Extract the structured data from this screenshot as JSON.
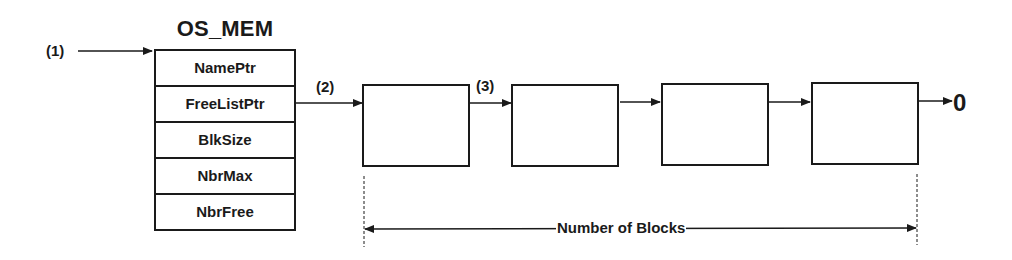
{
  "diagram": {
    "title": "OS_MEM",
    "struct_fields": [
      "NamePtr",
      "FreeListPtr",
      "BlkSize",
      "NbrMax",
      "NbrFree"
    ],
    "markers": {
      "m1": "(1)",
      "m2": "(2)",
      "m3": "(3)"
    },
    "blocks_count_visible": 4,
    "terminator": "0",
    "dimension_label": "Number of Blocks",
    "colors": {
      "stroke": "#1a1a1a",
      "background": "#ffffff"
    }
  }
}
